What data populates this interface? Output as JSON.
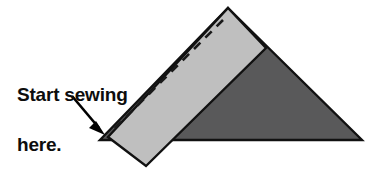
{
  "figure": {
    "background_color": "#FFFFFF",
    "annotation": {
      "line1": "Start sewing",
      "line2": "here.",
      "text_color": "#0D0D0D",
      "pointer": "arrow-pointing-to-left-tip"
    },
    "shapes": {
      "triangle": {
        "name": "fabric-triangle",
        "fill_color": "#59595A",
        "stroke_color": "#111111",
        "points": "228,8 362,140 100,140"
      },
      "band": {
        "name": "binding-strip",
        "fill_color": "#BFBFBF",
        "stroke_color": "#111111",
        "points": "228,8 266,48 146,166 108,137"
      },
      "stitch_line": {
        "name": "dashed-stitch-line",
        "stroke_color": "#1A1A1A",
        "dash_pattern": "9 7",
        "start": "223,20",
        "end": "110,133"
      },
      "arrow": {
        "name": "pointer-arrow",
        "color": "#000000",
        "start": "72,96",
        "end": "104,134"
      }
    }
  }
}
